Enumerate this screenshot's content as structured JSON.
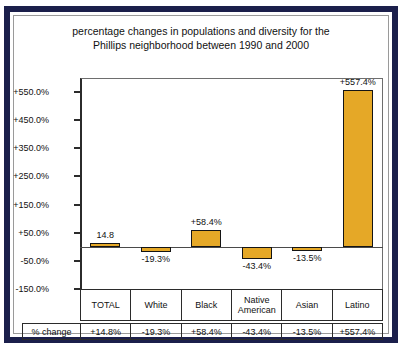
{
  "chart_data": {
    "type": "bar",
    "title": "percentage changes in populations and diversity for the Phillips neighborhood between 1990 and 2000",
    "title_line1": "percentage changes in populations and diversity for the",
    "title_line2": "Phillips neighborhood between 1990 and 2000",
    "xlabel": "",
    "ylabel": "",
    "categories": [
      "TOTAL",
      "White",
      "Black",
      "Native American",
      "Asian",
      "Latino"
    ],
    "values": [
      14.8,
      -19.3,
      58.4,
      -43.4,
      -13.5,
      557.4
    ],
    "bar_labels": [
      "14.8",
      "-19.3%",
      "+58.4%",
      "-43.4%",
      "-13.5%",
      "+557.4%"
    ],
    "ylim": [
      -150,
      600
    ],
    "ytick_values": [
      550,
      450,
      350,
      250,
      150,
      50,
      -50,
      -150
    ],
    "ytick_labels": [
      "+550.0%",
      "+450.0%",
      "+350.0%",
      "+250.0%",
      "+150.0%",
      "+50.0%",
      "-50.0%",
      "-150.0%"
    ],
    "grid": false,
    "legend": null,
    "bar_color": "#e5a827",
    "bar_edge_color": "#141414",
    "frame_color": "#1b1f4b",
    "data_table": {
      "row_label": "% change",
      "headers": [
        "TOTAL",
        "White",
        "Black",
        "Native American",
        "Asian",
        "Latino"
      ],
      "values": [
        "+14.8%",
        "-19.3%",
        "+58.4%",
        "-43.4%",
        "-13.5%",
        "+557.4%"
      ]
    }
  }
}
